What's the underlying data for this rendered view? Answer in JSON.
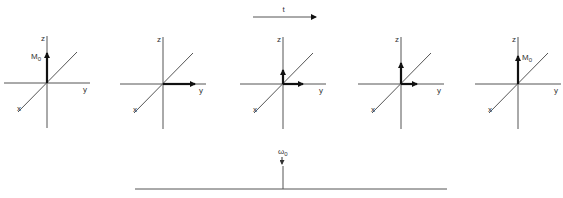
{
  "diagram": {
    "time_arrow": {
      "label": "t",
      "x1": 253,
      "x2": 316,
      "y": 17
    },
    "axis_labels": {
      "x": "x",
      "y": "y",
      "z": "z"
    },
    "moment_label": {
      "main": "M",
      "sub": "0"
    },
    "panels": [
      {
        "id": 1,
        "ox": 47,
        "oy": 83,
        "z_vec_len": 30,
        "y_vec_len": 0,
        "show_M0": true,
        "m0_side": "left"
      },
      {
        "id": 2,
        "ox": 163,
        "oy": 84,
        "z_vec_len": 0,
        "y_vec_len": 32,
        "show_M0": false
      },
      {
        "id": 3,
        "ox": 283,
        "oy": 84,
        "z_vec_len": 14,
        "y_vec_len": 20,
        "show_M0": false
      },
      {
        "id": 4,
        "ox": 401,
        "oy": 84,
        "z_vec_len": 21,
        "y_vec_len": 16,
        "show_M0": false
      },
      {
        "id": 5,
        "ox": 518,
        "oy": 84,
        "z_vec_len": 28,
        "y_vec_len": 0,
        "show_M0": true,
        "m0_side": "right"
      }
    ],
    "spectrum": {
      "baseline": {
        "x1": 135,
        "x2": 447,
        "y": 189
      },
      "peak": {
        "x": 283,
        "top": 166
      },
      "peak_label": {
        "main": "ω",
        "sub": "0"
      }
    }
  }
}
